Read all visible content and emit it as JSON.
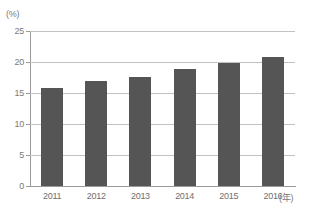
{
  "chart_data": {
    "type": "bar",
    "title": "",
    "xlabel": "(年)",
    "ylabel": "(%)",
    "categories": [
      "2011",
      "2012",
      "2013",
      "2014",
      "2015",
      "2016"
    ],
    "values": [
      15.8,
      17.0,
      17.6,
      18.8,
      19.8,
      20.8
    ],
    "ylim": [
      0,
      25
    ],
    "yticks": [
      0,
      5,
      10,
      15,
      20,
      25
    ],
    "ytick_labels": [
      "0",
      "5",
      "10",
      "15",
      "20",
      "25"
    ],
    "grid": true,
    "legend": false,
    "bar_color": "#555555",
    "gridline_color": "#c2c2c2",
    "axis_color": "#9a9a9a",
    "background_color": "#ffffff"
  },
  "axes": {
    "y_unit": "(%)",
    "x_unit": "(年)"
  }
}
